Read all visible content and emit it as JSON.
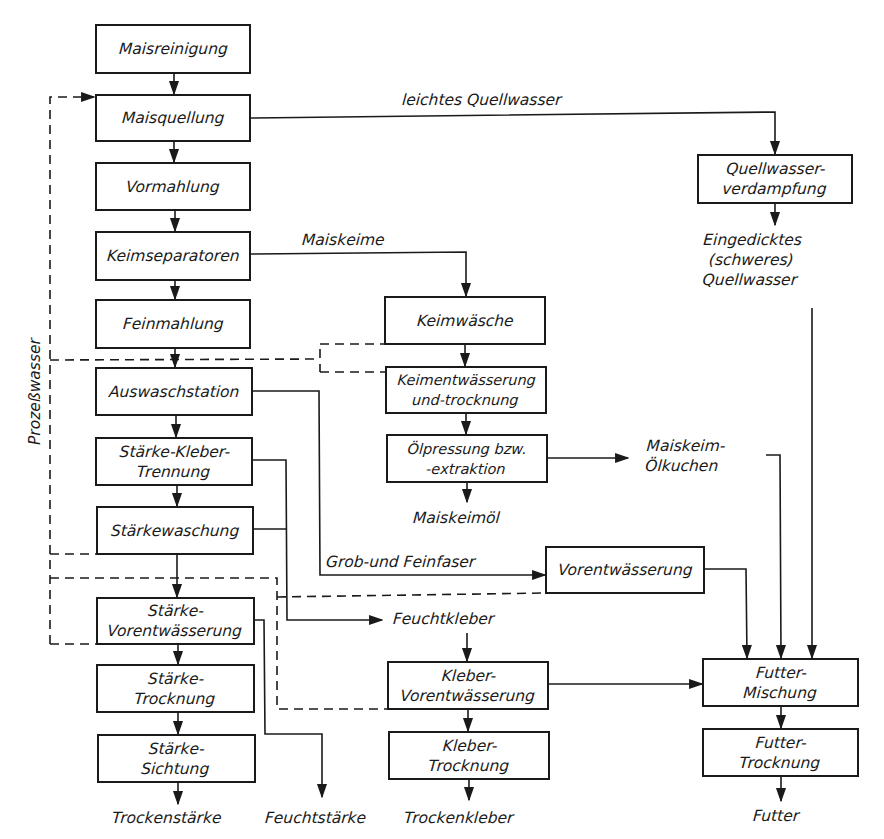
{
  "diagram": {
    "type": "process-flowchart",
    "language": "de",
    "nodes": {
      "maisreinigung": "Maisreinigung",
      "maisquellung": "Maisquellung",
      "vormahlung": "Vormahlung",
      "keimseparatoren": "Keimseparatoren",
      "feinmahlung": "Feinmahlung",
      "auswaschstation": "Auswaschstation",
      "staerke_kleber_trennung": "Stärke-Kleber-\nTrennung",
      "staerkewaschung": "Stärkewaschung",
      "staerke_vorentwaesserung": "Stärke-\nVorentwässerung",
      "staerke_trocknung": "Stärke-\nTrocknung",
      "staerke_sichtung": "Stärke-\nSichtung",
      "quellwasserverdampfung": "Quellwasser-\nverdampfung",
      "keimwaesche": "Keimwäsche",
      "keimentwaesserung": "Keimentwässerung\nund-trocknung",
      "oelpressung": "Ölpressung bzw.\n-extraktion",
      "vorentwaesserung": "Vorentwässerung",
      "kleber_vorentwaesserung": "Kleber-\nVorentwässerung",
      "kleber_trocknung": "Kleber-\nTrocknung",
      "futter_mischung": "Futter-\nMischung",
      "futter_trocknung": "Futter-\nTrocknung"
    },
    "edge_labels": {
      "leichtes_quellwasser": "leichtes Quellwasser",
      "maiskeime": "Maiskeime",
      "grob_feinfaser": "Grob-und Feinfaser",
      "feuchtkleber": "Feuchtkleber",
      "prozesswasser": "Prozeßwasser"
    },
    "outputs": {
      "eingedicktes_quellwasser": "Eingedicktes\n(schweres)\nQuellwasser",
      "maiskeimoel": "Maiskeimöl",
      "maiskeim_oelkuchen": "Maiskeim-\nÖlkuchen",
      "trockenstaerke": "Trockenstärke",
      "feuchtstaerke": "Feuchtstärke",
      "trockenkleber": "Trockenkleber",
      "futter": "Futter"
    },
    "edges": [
      {
        "from": "Maisreinigung",
        "to": "Maisquellung",
        "style": "solid"
      },
      {
        "from": "Maisquellung",
        "to": "Vormahlung",
        "style": "solid"
      },
      {
        "from": "Maisquellung",
        "to": "Quellwasserverdampfung",
        "label": "leichtes Quellwasser",
        "style": "solid"
      },
      {
        "from": "Vormahlung",
        "to": "Keimseparatoren",
        "style": "solid"
      },
      {
        "from": "Keimseparatoren",
        "to": "Feinmahlung",
        "style": "solid"
      },
      {
        "from": "Keimseparatoren",
        "to": "Keimwäsche",
        "label": "Maiskeime",
        "style": "solid"
      },
      {
        "from": "Feinmahlung",
        "to": "Auswaschstation",
        "style": "solid"
      },
      {
        "from": "Auswaschstation",
        "to": "Stärke-Kleber-Trennung",
        "style": "solid"
      },
      {
        "from": "Auswaschstation",
        "to": "Vorentwässerung",
        "label": "Grob-und Feinfaser",
        "style": "solid"
      },
      {
        "from": "Stärke-Kleber-Trennung",
        "to": "Stärkewaschung",
        "style": "solid"
      },
      {
        "from": "Stärke-Kleber-Trennung",
        "to": "Feuchtkleber",
        "style": "solid"
      },
      {
        "from": "Stärkewaschung",
        "to": "Feuchtkleber",
        "style": "solid"
      },
      {
        "from": "Stärkewaschung",
        "to": "Stärke-Vorentwässerung",
        "style": "solid"
      },
      {
        "from": "Stärke-Vorentwässerung",
        "to": "Stärke-Trocknung",
        "style": "solid"
      },
      {
        "from": "Stärke-Vorentwässerung",
        "to": "Feuchtstärke",
        "style": "solid"
      },
      {
        "from": "Stärke-Trocknung",
        "to": "Stärke-Sichtung",
        "style": "solid"
      },
      {
        "from": "Stärke-Sichtung",
        "to": "Trockenstärke",
        "style": "solid"
      },
      {
        "from": "Quellwasserverdampfung",
        "to": "Eingedicktes (schweres) Quellwasser",
        "style": "solid"
      },
      {
        "from": "Eingedicktes (schweres) Quellwasser",
        "to": "Futter-Mischung",
        "style": "solid"
      },
      {
        "from": "Keimwäsche",
        "to": "Keimentwässerung und-trocknung",
        "style": "solid"
      },
      {
        "from": "Keimentwässerung und-trocknung",
        "to": "Ölpressung bzw. -extraktion",
        "style": "solid"
      },
      {
        "from": "Ölpressung bzw. -extraktion",
        "to": "Maiskeimöl",
        "style": "solid"
      },
      {
        "from": "Ölpressung bzw. -extraktion",
        "to": "Maiskeim-Ölkuchen",
        "style": "solid"
      },
      {
        "from": "Maiskeim-Ölkuchen",
        "to": "Futter-Mischung",
        "style": "solid"
      },
      {
        "from": "Vorentwässerung",
        "to": "Futter-Mischung",
        "style": "solid"
      },
      {
        "from": "Feuchtkleber",
        "to": "Kleber-Vorentwässerung",
        "style": "solid"
      },
      {
        "from": "Kleber-Vorentwässerung",
        "to": "Futter-Mischung",
        "style": "solid"
      },
      {
        "from": "Kleber-Vorentwässerung",
        "to": "Kleber-Trocknung",
        "style": "solid"
      },
      {
        "from": "Kleber-Trocknung",
        "to": "Trockenkleber",
        "style": "solid"
      },
      {
        "from": "Futter-Mischung",
        "to": "Futter-Trocknung",
        "style": "solid"
      },
      {
        "from": "Futter-Trocknung",
        "to": "Futter",
        "style": "solid"
      },
      {
        "from": "Prozeßwasser loop",
        "to": "Maisquellung",
        "label": "Prozeßwasser",
        "style": "dashed"
      }
    ]
  }
}
